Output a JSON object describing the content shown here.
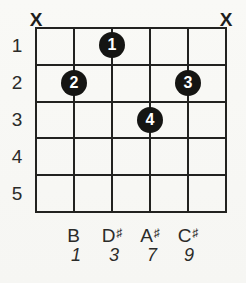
{
  "chord_diagram": {
    "strings_count": 6,
    "frets_shown": 5,
    "top_markers": {
      "left": "X",
      "right": "X"
    },
    "fret_numbers": [
      "1",
      "2",
      "3",
      "4",
      "5"
    ],
    "fingerings": [
      {
        "finger": "1",
        "string": 3,
        "fret": 1
      },
      {
        "finger": "2",
        "string": 2,
        "fret": 2
      },
      {
        "finger": "3",
        "string": 5,
        "fret": 2
      },
      {
        "finger": "4",
        "string": 4,
        "fret": 3
      }
    ],
    "notes": [
      {
        "letter": "B",
        "accidental": ""
      },
      {
        "letter": "D",
        "accidental": "♯"
      },
      {
        "letter": "A",
        "accidental": "♯"
      },
      {
        "letter": "C",
        "accidental": "♯"
      }
    ],
    "intervals": [
      "1",
      "3",
      "7",
      "9"
    ],
    "colors": {
      "line": "#222220",
      "dot_fill": "#151513",
      "dot_text": "#ffffff",
      "text": "#2b2b29",
      "background": "#f7f7f4"
    }
  }
}
